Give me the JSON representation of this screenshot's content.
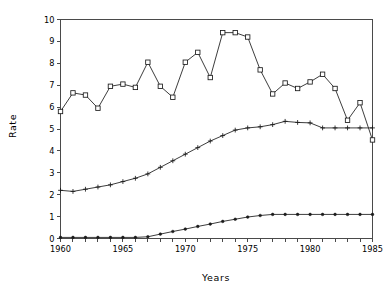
{
  "chart_data": {
    "type": "line",
    "title": "",
    "xlabel": "Years",
    "ylabel": "Rate",
    "xlim": [
      1960,
      1985
    ],
    "ylim": [
      0,
      10
    ],
    "grid": false,
    "legend": "none",
    "x": [
      1960,
      1961,
      1962,
      1963,
      1964,
      1965,
      1966,
      1967,
      1968,
      1969,
      1970,
      1971,
      1972,
      1973,
      1974,
      1975,
      1976,
      1977,
      1978,
      1979,
      1980,
      1981,
      1982,
      1983,
      1984,
      1985
    ],
    "xticks": [
      1960,
      1961,
      1962,
      1963,
      1964,
      1965,
      1966,
      1967,
      1968,
      1969,
      1970,
      1971,
      1972,
      1973,
      1974,
      1975,
      1976,
      1977,
      1978,
      1979,
      1980,
      1981,
      1982,
      1983,
      1984,
      1985
    ],
    "xtick_labels": [
      "1960",
      "",
      "",
      "",
      "",
      "1965",
      "",
      "",
      "",
      "",
      "1970",
      "",
      "",
      "",
      "",
      "1975",
      "",
      "",
      "",
      "",
      "1980",
      "",
      "",
      "",
      "",
      "1985"
    ],
    "yticks": [
      0,
      1,
      2,
      3,
      4,
      5,
      6,
      7,
      8,
      9,
      10
    ],
    "ytick_labels": [
      "0",
      "1",
      "2",
      "3",
      "4",
      "5",
      "6",
      "7",
      "8",
      "9",
      "10"
    ],
    "series": [
      {
        "name": "upper-series",
        "marker": "square",
        "values": [
          5.8,
          6.65,
          6.55,
          5.95,
          6.95,
          7.05,
          6.9,
          8.05,
          6.95,
          6.45,
          8.05,
          8.5,
          7.35,
          9.4,
          9.4,
          9.2,
          7.7,
          6.6,
          7.1,
          6.85,
          7.15,
          7.5,
          6.85,
          5.4,
          6.2,
          4.5
        ]
      },
      {
        "name": "middle-series",
        "marker": "plus",
        "values": [
          2.2,
          2.15,
          2.25,
          2.35,
          2.45,
          2.6,
          2.75,
          2.95,
          3.25,
          3.55,
          3.85,
          4.15,
          4.45,
          4.7,
          4.95,
          5.05,
          5.1,
          5.2,
          5.35,
          5.3,
          5.28,
          5.05,
          5.05,
          5.05,
          5.05,
          5.05
        ]
      },
      {
        "name": "lower-series",
        "marker": "dot",
        "values": [
          0.05,
          0.05,
          0.05,
          0.05,
          0.05,
          0.05,
          0.05,
          0.08,
          0.2,
          0.32,
          0.43,
          0.55,
          0.66,
          0.78,
          0.88,
          0.98,
          1.05,
          1.1,
          1.1,
          1.1,
          1.1,
          1.1,
          1.1,
          1.1,
          1.1,
          1.1
        ]
      }
    ]
  },
  "axis": {
    "x_title": "Years",
    "y_title": "Rate"
  }
}
